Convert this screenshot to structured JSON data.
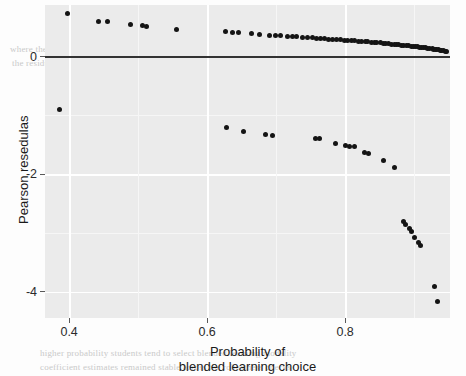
{
  "chart_data": {
    "type": "scatter",
    "title": "",
    "xlabel": "Probability of blended learning choice",
    "xlabel_line1": "Probability of",
    "xlabel_line2": "blended learning choice",
    "ylabel": "Pearson resedulas",
    "xlim": [
      0.365,
      0.952
    ],
    "ylim": [
      -4.45,
      0.88
    ],
    "xticks": [
      0.4,
      0.6,
      0.8
    ],
    "xticklabels": [
      "0.4",
      "0.6",
      "0.8"
    ],
    "yticks": [
      0,
      -2,
      -4
    ],
    "yticklabels": [
      "0",
      "-2",
      "-4"
    ],
    "y_minor_ticks": [
      -1,
      -3
    ],
    "grid": true,
    "grid_color": "#ffffff",
    "panel_background": "#ebebeb",
    "point_color": "#141414",
    "reference_line": {
      "y": 0,
      "color": "#333333",
      "orientation": "horizontal"
    },
    "legend": null,
    "series": [
      {
        "name": "Pearson residuals",
        "points": [
          [
            0.397,
            0.74
          ],
          [
            0.443,
            0.6
          ],
          [
            0.455,
            0.595
          ],
          [
            0.489,
            0.545
          ],
          [
            0.506,
            0.525
          ],
          [
            0.512,
            0.522
          ],
          [
            0.556,
            0.455
          ],
          [
            0.626,
            0.425
          ],
          [
            0.637,
            0.415
          ],
          [
            0.645,
            0.412
          ],
          [
            0.665,
            0.392
          ],
          [
            0.676,
            0.385
          ],
          [
            0.69,
            0.368
          ],
          [
            0.699,
            0.362
          ],
          [
            0.707,
            0.358
          ],
          [
            0.716,
            0.345
          ],
          [
            0.723,
            0.342
          ],
          [
            0.73,
            0.338
          ],
          [
            0.738,
            0.33
          ],
          [
            0.745,
            0.325
          ],
          [
            0.752,
            0.32
          ],
          [
            0.758,
            0.314
          ],
          [
            0.764,
            0.31
          ],
          [
            0.77,
            0.305
          ],
          [
            0.776,
            0.3
          ],
          [
            0.782,
            0.296
          ],
          [
            0.788,
            0.291
          ],
          [
            0.793,
            0.286
          ],
          [
            0.799,
            0.282
          ],
          [
            0.804,
            0.278
          ],
          [
            0.809,
            0.273
          ],
          [
            0.814,
            0.269
          ],
          [
            0.819,
            0.264
          ],
          [
            0.824,
            0.26
          ],
          [
            0.829,
            0.255
          ],
          [
            0.833,
            0.251
          ],
          [
            0.838,
            0.246
          ],
          [
            0.842,
            0.242
          ],
          [
            0.846,
            0.238
          ],
          [
            0.851,
            0.233
          ],
          [
            0.855,
            0.229
          ],
          [
            0.859,
            0.224
          ],
          [
            0.863,
            0.22
          ],
          [
            0.867,
            0.215
          ],
          [
            0.871,
            0.211
          ],
          [
            0.874,
            0.206
          ],
          [
            0.878,
            0.202
          ],
          [
            0.882,
            0.197
          ],
          [
            0.885,
            0.193
          ],
          [
            0.889,
            0.188
          ],
          [
            0.892,
            0.184
          ],
          [
            0.896,
            0.179
          ],
          [
            0.899,
            0.175
          ],
          [
            0.902,
            0.17
          ],
          [
            0.905,
            0.166
          ],
          [
            0.908,
            0.161
          ],
          [
            0.911,
            0.157
          ],
          [
            0.914,
            0.152
          ],
          [
            0.917,
            0.148
          ],
          [
            0.92,
            0.143
          ],
          [
            0.923,
            0.139
          ],
          [
            0.926,
            0.134
          ],
          [
            0.928,
            0.13
          ],
          [
            0.931,
            0.125
          ],
          [
            0.933,
            0.121
          ],
          [
            0.936,
            0.116
          ],
          [
            0.938,
            0.112
          ],
          [
            0.94,
            0.107
          ],
          [
            0.943,
            0.1
          ],
          [
            0.945,
            0.092
          ],
          [
            0.947,
            0.085
          ],
          [
            0.386,
            -0.9
          ],
          [
            0.628,
            -1.21
          ],
          [
            0.653,
            -1.27
          ],
          [
            0.684,
            -1.33
          ],
          [
            0.695,
            -1.335
          ],
          [
            0.757,
            -1.4
          ],
          [
            0.763,
            -1.4
          ],
          [
            0.786,
            -1.47
          ],
          [
            0.8,
            -1.52
          ],
          [
            0.807,
            -1.525
          ],
          [
            0.813,
            -1.53
          ],
          [
            0.828,
            -1.63
          ],
          [
            0.834,
            -1.655
          ],
          [
            0.856,
            -1.76
          ],
          [
            0.872,
            -1.88
          ],
          [
            0.884,
            -2.8
          ],
          [
            0.888,
            -2.85
          ],
          [
            0.893,
            -2.93
          ],
          [
            0.896,
            -2.98
          ],
          [
            0.901,
            -3.08
          ],
          [
            0.907,
            -3.17
          ],
          [
            0.909,
            -3.21
          ],
          [
            0.93,
            -3.92
          ],
          [
            0.934,
            -4.17
          ]
        ]
      }
    ]
  },
  "background_text": {
    "lines": [
      "the probability of the learner choosing blended learning and how",
      "that probability is estimated by the model for each observation",
      "where the predicted and the observed are identified are derived and how",
      "the residuals A diagnostic of the estimates of the model",
      "the residual values versus the predicted probabilities",
      "Table 5 Results of the logistic regression",
      "higher probability students tend to select blended learning modality",
      "coefficient estimates remained stable across the robustness checks"
    ]
  }
}
